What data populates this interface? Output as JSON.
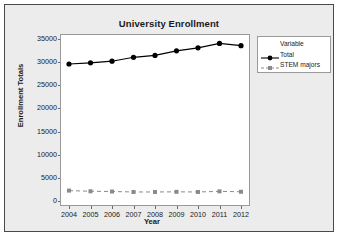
{
  "window": {
    "background_color": "#ececec",
    "border_color": "#4a4a4a"
  },
  "chart_data": {
    "type": "line",
    "title": "University Enrollment",
    "xlabel": "Year",
    "ylabel": "Enrollment Totals",
    "categories": [
      "2004",
      "2005",
      "2006",
      "2007",
      "2008",
      "2009",
      "2010",
      "2011",
      "2012"
    ],
    "x": [
      2004,
      2005,
      2006,
      2007,
      2008,
      2009,
      2010,
      2011,
      2012
    ],
    "xlim": [
      2004,
      2012
    ],
    "ylim": [
      0,
      35000
    ],
    "yticks": [
      0,
      5000,
      10000,
      15000,
      20000,
      25000,
      30000,
      35000
    ],
    "ytick_labels": [
      "0",
      "5000",
      "10000",
      "15000",
      "20000",
      "25000",
      "30000",
      "35000"
    ],
    "grid": false,
    "legend_position": "right",
    "legend_title": "Variable",
    "series": [
      {
        "name": "Total",
        "values": [
          29600,
          29850,
          30200,
          31050,
          31450,
          32450,
          33100,
          34050,
          33550
        ],
        "color": "#000000",
        "line_style": "solid",
        "marker": "circle"
      },
      {
        "name": "STEM majors",
        "values": [
          2250,
          2100,
          2050,
          1950,
          1950,
          1980,
          1950,
          2080,
          2000
        ],
        "color": "#8a8a8a",
        "line_style": "dashed",
        "marker": "square"
      }
    ]
  }
}
